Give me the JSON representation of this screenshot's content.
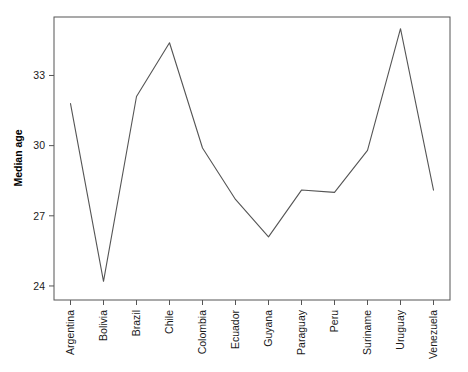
{
  "chart_data": {
    "type": "line",
    "title": "",
    "xlabel": "",
    "ylabel": "Median age",
    "categories": [
      "Argentina",
      "Bolivia",
      "Brazil",
      "Chile",
      "Colombia",
      "Ecuador",
      "Guyana",
      "Paraguay",
      "Peru",
      "Suriname",
      "Uruguay",
      "Venezuela"
    ],
    "values": [
      31.8,
      24.2,
      32.1,
      34.4,
      29.9,
      27.7,
      26.1,
      28.1,
      28.0,
      29.8,
      35.0,
      28.1
    ],
    "yticks": [
      24,
      27,
      30,
      33
    ],
    "ytick_labels": [
      "24",
      "27",
      "30",
      "33"
    ],
    "ylim": [
      23.4,
      35.5
    ],
    "grid": false,
    "legend": null,
    "line_color": "#555555",
    "frame_color": "#555555"
  },
  "axes": {
    "y_title": "Median age"
  }
}
